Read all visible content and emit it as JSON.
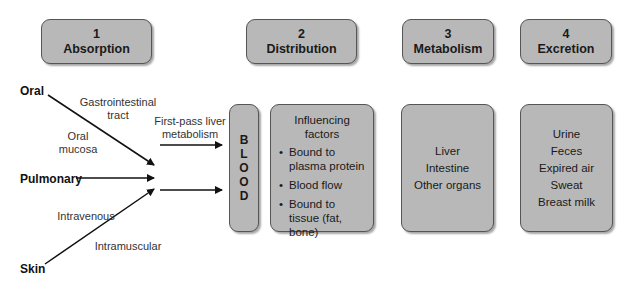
{
  "stages": [
    {
      "number": "1",
      "name": "Absorption"
    },
    {
      "number": "2",
      "name": "Distribution"
    },
    {
      "number": "3",
      "name": "Metabolism"
    },
    {
      "number": "4",
      "name": "Excretion"
    }
  ],
  "routes": {
    "oral": "Oral",
    "pulmonary": "Pulmonary",
    "skin": "Skin"
  },
  "route_labels": {
    "gi_tract_line1": "Gastrointestinal",
    "gi_tract_line2": "tract",
    "oral_mucosa_line1": "Oral",
    "oral_mucosa_line2": "mucosa",
    "intravenous": "Intravenous",
    "intramuscular": "Intramuscular",
    "first_pass_line1": "First-pass liver",
    "first_pass_line2": "metabolism"
  },
  "blood": [
    "B",
    "L",
    "O",
    "O",
    "D"
  ],
  "distribution": {
    "title_line1": "Influencing",
    "title_line2": "factors",
    "factors": [
      {
        "line1": "Bound to",
        "line2": "plasma protein",
        "line3": ""
      },
      {
        "line1": "Blood flow",
        "line2": "",
        "line3": ""
      },
      {
        "line1": "Bound to",
        "line2": "tissue (fat,",
        "line3": "bone)"
      }
    ]
  },
  "metabolism": {
    "sites": [
      "Liver",
      "Intestine",
      "Other organs"
    ]
  },
  "excretion": {
    "routes": [
      "Urine",
      "Feces",
      "Expired air",
      "Sweat",
      "Breast milk"
    ]
  }
}
